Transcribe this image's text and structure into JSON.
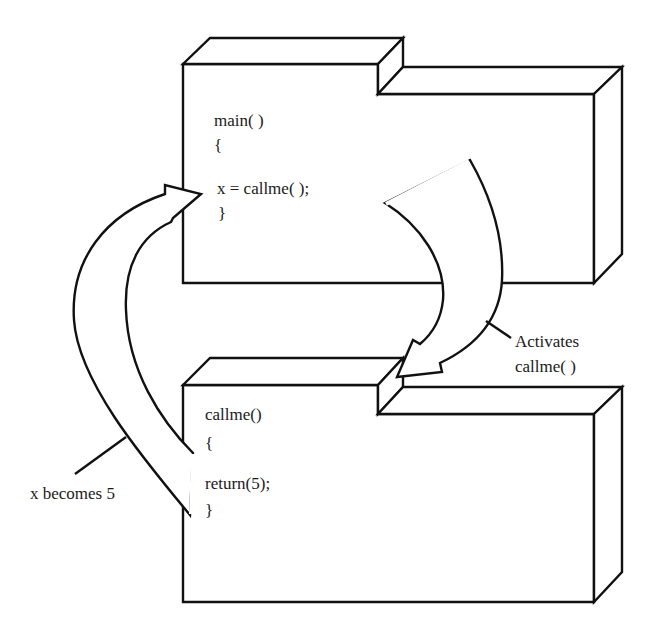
{
  "diagram": {
    "type": "function-call-flow",
    "blocks": [
      {
        "id": "main-block",
        "lines": [
          "main( )",
          "{",
          "x = callme( );",
          "}"
        ]
      },
      {
        "id": "callme-block",
        "lines": [
          "callme()",
          "{",
          "return(5);",
          "}"
        ]
      }
    ],
    "arrows": [
      {
        "id": "activate-arrow",
        "from": "main-block",
        "to": "callme-block",
        "label": [
          "Activates",
          "callme( )"
        ]
      },
      {
        "id": "return-arrow",
        "from": "callme-block",
        "to": "main-block",
        "label": [
          "x becomes 5"
        ]
      }
    ],
    "colors": {
      "stroke": "#111111",
      "fill": "#ffffff",
      "text": "#1a1a1a"
    }
  },
  "labels": {
    "activates_line1": "Activates",
    "activates_line2": "callme( )",
    "return_label": "x becomes 5"
  },
  "main_code": {
    "line1": "main( )",
    "line2": "{",
    "line3": "x = callme( );",
    "line4": "}"
  },
  "callme_code": {
    "line1": "callme()",
    "line2": "{",
    "line3": "return(5);",
    "line4": "}"
  }
}
